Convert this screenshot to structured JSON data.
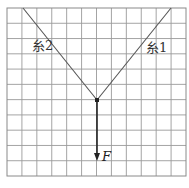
{
  "diagram": {
    "grid": {
      "columns": 12,
      "rows": 11,
      "line_color": "#9a9a9a",
      "border_color": "#8a8a8a"
    },
    "strings": [
      {
        "id": "string1",
        "label": "糸1"
      },
      {
        "id": "string2",
        "label": "糸2"
      }
    ],
    "force": {
      "label": "F",
      "color": "#222222"
    },
    "junction": {
      "color": "#222222"
    }
  }
}
